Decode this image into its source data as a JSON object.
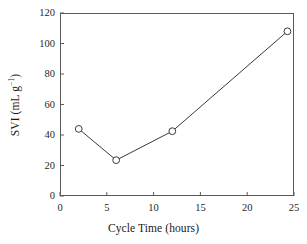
{
  "chart_data": {
    "type": "line",
    "title": "",
    "subtitle": "",
    "xlabel": "Cycle Time (hours)",
    "ylabel": "SVI (mL g⁻¹)",
    "ylabel_parts": {
      "prefix": "SVI (mL",
      "unit_base": "g",
      "unit_exponent": "−1",
      "suffix": ")"
    },
    "x": [
      2,
      6,
      12,
      24.3
    ],
    "y": [
      44,
      23.5,
      42.5,
      108
    ],
    "points": [
      {
        "x": 2,
        "y": 44
      },
      {
        "x": 6,
        "y": 23.5
      },
      {
        "x": 12,
        "y": 42.5
      },
      {
        "x": 24.3,
        "y": 108
      }
    ],
    "series": [
      {
        "name": "SVI",
        "x": [
          2,
          6,
          12,
          24.3
        ],
        "values": [
          44,
          23.5,
          42.5,
          108
        ],
        "marker": "open-circle",
        "line_color": "#3a3a3a",
        "marker_edge_color": "#3a3a3a",
        "marker_face_color": "#ffffff"
      }
    ],
    "xlim": [
      0,
      25
    ],
    "ylim": [
      0,
      120
    ],
    "xticks": [
      0,
      5,
      10,
      15,
      20,
      25
    ],
    "yticks": [
      0,
      20,
      40,
      60,
      80,
      100,
      120
    ],
    "xtick_labels": [
      "0",
      "5",
      "10",
      "15",
      "20",
      "25"
    ],
    "ytick_labels": [
      "0",
      "20",
      "40",
      "60",
      "80",
      "100",
      "120"
    ],
    "grid": false,
    "legend": null,
    "legend_position": "none",
    "annotations": [],
    "frame": "box",
    "tick_direction": "in",
    "colors": {
      "line": "#3a3a3a",
      "axis": "#5a5a5a",
      "text": "#1a1a1a",
      "background": "#ffffff"
    }
  }
}
